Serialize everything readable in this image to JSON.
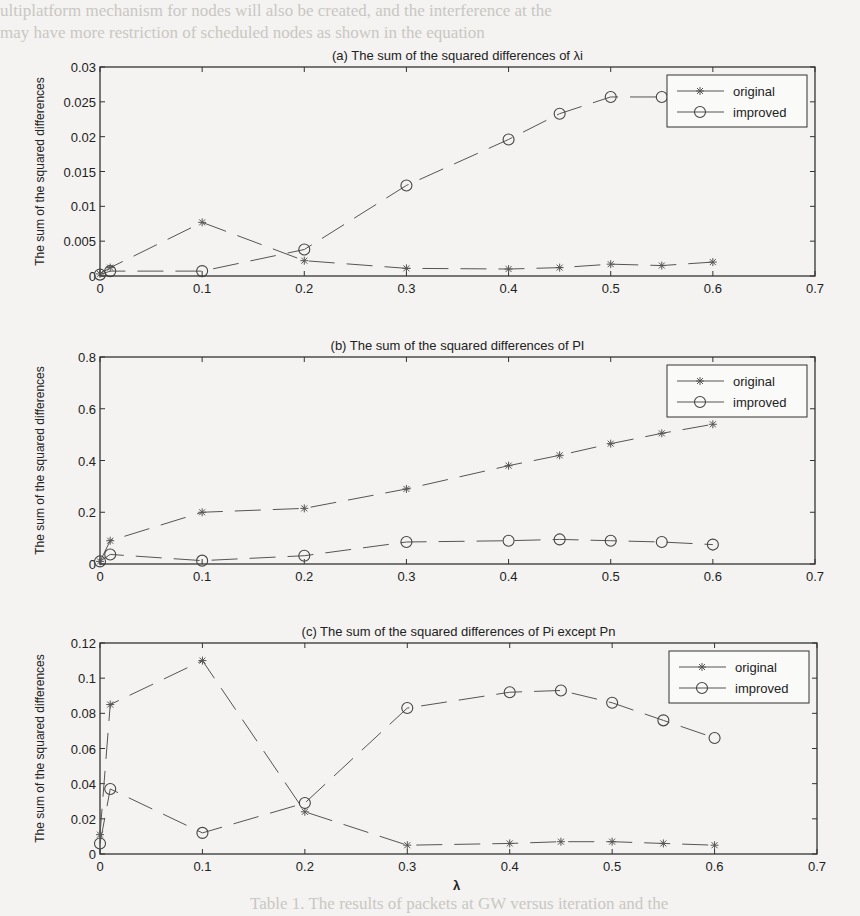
{
  "page": {
    "background_text_top": "ultiplatform mechanism for nodes will also be created, and the interference at the",
    "background_text_top2": "may have more restriction of scheduled nodes as shown in the equation",
    "background_text_bottom": "Table 1. The results of packets at GW versus iteration and the"
  },
  "chart_data": [
    {
      "type": "line",
      "title": "(a) The sum of the squared differences of λi",
      "xlabel": "λ",
      "ylabel": "The sum of the squared differences",
      "xlim": [
        0,
        0.7
      ],
      "ylim": [
        0,
        0.03
      ],
      "xticks": [
        "0",
        "0.1",
        "0.2",
        "0.3",
        "0.4",
        "0.5",
        "0.6",
        "0.7"
      ],
      "yticks": [
        "0",
        "0.005",
        "0.01",
        "0.015",
        "0.02",
        "0.025",
        "0.03"
      ],
      "grid": false,
      "legend_position": "upper right",
      "series": [
        {
          "name": "original",
          "marker": "*",
          "line": "dashed",
          "x": [
            0,
            0.01,
            0.1,
            0.2,
            0.3,
            0.4,
            0.45,
            0.5,
            0.55,
            0.6
          ],
          "values": [
            0.0003,
            0.0012,
            0.0077,
            0.0022,
            0.0011,
            0.001,
            0.0012,
            0.0017,
            0.0015,
            0.002
          ]
        },
        {
          "name": "improved",
          "marker": "o",
          "line": "dashed",
          "x": [
            0,
            0.01,
            0.1,
            0.2,
            0.3,
            0.4,
            0.45,
            0.5,
            0.55
          ],
          "values": [
            0.0002,
            0.0007,
            0.0007,
            0.0038,
            0.013,
            0.0196,
            0.0233,
            0.0257,
            0.0257
          ]
        }
      ]
    },
    {
      "type": "line",
      "title": "(b) The sum of the squared differences of PI",
      "xlabel": "λ",
      "ylabel": "The sum of the squared differences",
      "xlim": [
        0,
        0.7
      ],
      "ylim": [
        0,
        0.8
      ],
      "xticks": [
        "0",
        "0.1",
        "0.2",
        "0.3",
        "0.4",
        "0.5",
        "0.6",
        "0.7"
      ],
      "yticks": [
        "0",
        "0.2",
        "0.4",
        "0.6",
        "0.8"
      ],
      "grid": false,
      "legend_position": "upper right",
      "series": [
        {
          "name": "original",
          "marker": "*",
          "line": "dashed",
          "x": [
            0,
            0.01,
            0.1,
            0.2,
            0.3,
            0.4,
            0.45,
            0.5,
            0.55,
            0.6
          ],
          "values": [
            0.01,
            0.09,
            0.2,
            0.215,
            0.29,
            0.38,
            0.42,
            0.465,
            0.505,
            0.54
          ]
        },
        {
          "name": "improved",
          "marker": "o",
          "line": "dashed",
          "x": [
            0,
            0.01,
            0.1,
            0.2,
            0.3,
            0.4,
            0.45,
            0.5,
            0.55,
            0.6
          ],
          "values": [
            0.01,
            0.037,
            0.013,
            0.032,
            0.085,
            0.09,
            0.095,
            0.09,
            0.085,
            0.075
          ]
        }
      ]
    },
    {
      "type": "line",
      "title": "(c) The sum of the squared differences of Pi except Pn",
      "xlabel": "λ",
      "ylabel": "The sum of the squared differences",
      "xlim": [
        0,
        0.7
      ],
      "ylim": [
        0,
        0.12
      ],
      "xticks": [
        "0",
        "0.1",
        "0.2",
        "0.3",
        "0.4",
        "0.5",
        "0.6",
        "0.7"
      ],
      "yticks": [
        "0",
        "0.02",
        "0.04",
        "0.06",
        "0.08",
        "0.1",
        "0.12"
      ],
      "grid": false,
      "legend_position": "upper right",
      "series": [
        {
          "name": "original",
          "marker": "*",
          "line": "dashed",
          "x": [
            0,
            0.01,
            0.1,
            0.2,
            0.3,
            0.4,
            0.45,
            0.5,
            0.55,
            0.6
          ],
          "values": [
            0.011,
            0.085,
            0.11,
            0.024,
            0.005,
            0.006,
            0.007,
            0.007,
            0.006,
            0.005
          ]
        },
        {
          "name": "improved",
          "marker": "o",
          "line": "dashed",
          "x": [
            0,
            0.01,
            0.1,
            0.2,
            0.3,
            0.4,
            0.45,
            0.5,
            0.55,
            0.6
          ],
          "values": [
            0.006,
            0.037,
            0.012,
            0.029,
            0.083,
            0.092,
            0.093,
            0.086,
            0.076,
            0.066
          ]
        }
      ]
    }
  ]
}
